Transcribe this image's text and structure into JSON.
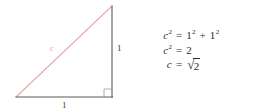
{
  "diagram": {
    "shape": "right triangle",
    "labels": {
      "hypotenuse": "c",
      "leg_vertical": "1",
      "leg_horizontal": "1"
    },
    "colors": {
      "hypotenuse": "#e8a9ad",
      "legs": "#5a5a52",
      "right_angle_marker": "#9a9a92",
      "label_text": "#3a3a3a",
      "equation_text": "#2b2b2b",
      "background": "#ffffff"
    },
    "geometry": {
      "apex": [
        112,
        6
      ],
      "right_angle_vertex": [
        112,
        97
      ],
      "left_vertex": [
        16,
        97
      ],
      "right_angle_marker_size": 8
    }
  },
  "equations": [
    {
      "lhs_var": "c",
      "lhs_exp": "2",
      "operator": "=",
      "rhs": "1² + 1²",
      "rhs_parts": [
        {
          "base": "1",
          "exp": "2"
        },
        {
          "base": "1",
          "exp": "2"
        }
      ],
      "rhs_join": "+"
    },
    {
      "lhs_var": "c",
      "lhs_exp": "2",
      "operator": "=",
      "rhs": "2"
    },
    {
      "lhs_var": "c",
      "lhs_exp": "",
      "operator": "=",
      "rhs": "√2",
      "radical_symbol": "√",
      "radicand": "2"
    }
  ]
}
